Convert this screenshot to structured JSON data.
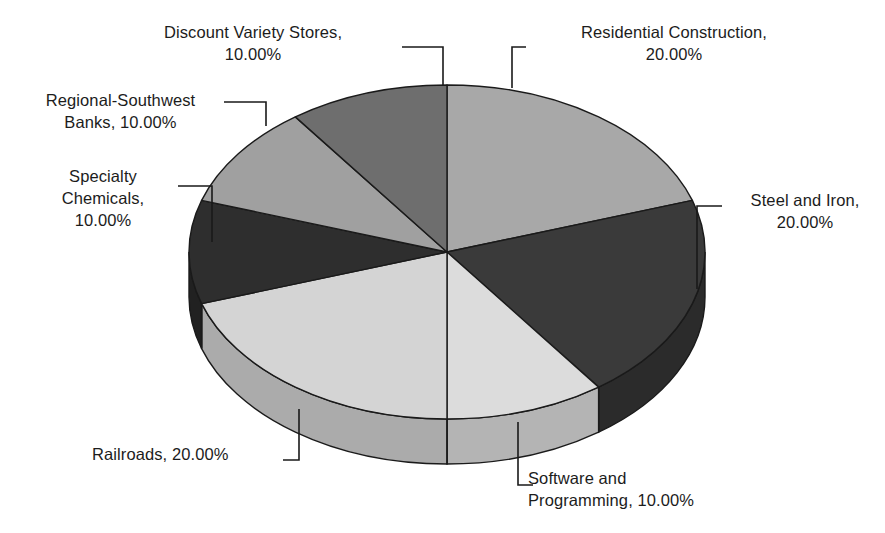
{
  "chart_data": {
    "type": "pie",
    "title": "",
    "subtitle": "",
    "xlabel": "",
    "ylabel": "",
    "legend_position": "none",
    "grid": false,
    "three_d": true,
    "start_angle_deg": 0,
    "direction": "clockwise",
    "label_format": "{name}, {value}%",
    "categories": [
      "Residential Construction",
      "Steel and Iron",
      "Software and Programming",
      "Railroads",
      "Specialty Chemicals",
      "Regional-Southwest Banks",
      "Discount Variety Stores"
    ],
    "values": [
      20.0,
      20.0,
      10.0,
      20.0,
      10.0,
      10.0,
      10.0
    ],
    "value_labels": [
      "20.00%",
      "20.00%",
      "10.00%",
      "20.00%",
      "10.00%",
      "10.00%",
      "10.00%"
    ],
    "colors": [
      "#a8a8a8",
      "#3a3a3a",
      "#dcdcdc",
      "#d4d4d4",
      "#2e2e2e",
      "#a0a0a0",
      "#6e6e6e"
    ],
    "side_colors": [
      "#8c8c8c",
      "#2b2b2b",
      "#b4b4b4",
      "#ababab",
      "#212121",
      "#848484",
      "#585858"
    ],
    "slices": [
      {
        "name": "Residential Construction",
        "value": 20.0,
        "value_label": "20.00%",
        "color": "#a8a8a8"
      },
      {
        "name": "Steel and Iron",
        "value": 20.0,
        "value_label": "20.00%",
        "color": "#3a3a3a"
      },
      {
        "name": "Software and Programming",
        "value": 10.0,
        "value_label": "10.00%",
        "color": "#dcdcdc"
      },
      {
        "name": "Railroads",
        "value": 20.0,
        "value_label": "20.00%",
        "color": "#d4d4d4"
      },
      {
        "name": "Specialty Chemicals",
        "value": 10.0,
        "value_label": "10.00%",
        "color": "#2e2e2e"
      },
      {
        "name": "Regional-Southwest Banks",
        "value": 10.0,
        "value_label": "10.00%",
        "color": "#a0a0a0"
      },
      {
        "name": "Discount Variety Stores",
        "value": 10.0,
        "value_label": "10.00%",
        "color": "#6e6e6e"
      }
    ]
  },
  "labels": {
    "residential_construction": "Residential Construction,\n20.00%",
    "steel_and_iron": "Steel and Iron,\n20.00%",
    "software_and_programming": "Software and\nProgramming, 10.00%",
    "railroads": "Railroads, 20.00%",
    "specialty_chemicals": "Specialty\nChemicals,\n10.00%",
    "regional_southwest_banks": "Regional-Southwest\nBanks, 10.00%",
    "discount_variety_stores": "Discount Variety Stores,\n10.00%"
  },
  "style": {
    "background": "#ffffff",
    "text_color": "#1c1c1c",
    "outline_color": "#1a1a1a",
    "leader_color": "#1a1a1a"
  },
  "geometry": {
    "center_x": 447,
    "center_y": 252,
    "radius_x": 258,
    "radius_y": 167,
    "depth": 45
  }
}
